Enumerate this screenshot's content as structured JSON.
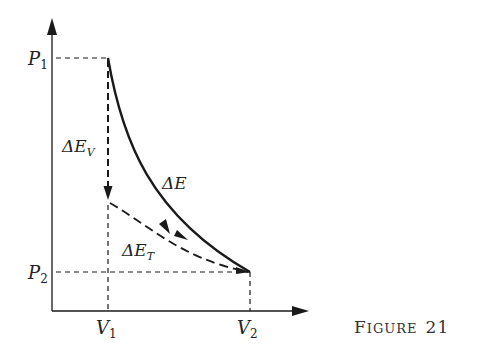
{
  "figure": {
    "caption_first": "F",
    "caption_rest": "IGURE",
    "caption_number": "21"
  },
  "axes": {
    "y_labels": [
      {
        "main": "P",
        "sub": "1"
      },
      {
        "main": "P",
        "sub": "2"
      }
    ],
    "x_labels": [
      {
        "main": "V",
        "sub": "1"
      },
      {
        "main": "V",
        "sub": "2"
      }
    ]
  },
  "curves": {
    "delta_e": {
      "main": "ΔE",
      "sub": ""
    },
    "delta_e_v": {
      "main": "ΔE",
      "sub": "V"
    },
    "delta_e_t": {
      "main": "ΔE",
      "sub": "T"
    }
  },
  "colors": {
    "ink": "#1a1a1a",
    "background": "#ffffff"
  }
}
